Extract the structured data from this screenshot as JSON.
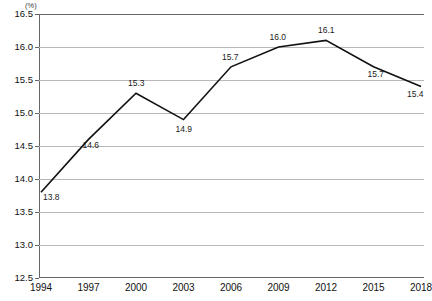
{
  "chart_data": {
    "type": "line",
    "title": "",
    "subtitle": "",
    "xlabel": "",
    "ylabel": "",
    "unit_label": "(%)",
    "categories": [
      "1994",
      "1997",
      "2000",
      "2003",
      "2006",
      "2009",
      "2012",
      "2015",
      "2018"
    ],
    "values": [
      13.8,
      14.6,
      15.3,
      14.9,
      15.7,
      16.0,
      16.1,
      15.7,
      15.4
    ],
    "point_labels": [
      "13.8",
      "14.6",
      "15.3",
      "14.9",
      "15.7",
      "16.0",
      "16.1",
      "15.7",
      "15.4"
    ],
    "ylim": [
      12.5,
      16.5
    ],
    "ytick_labels": [
      "16.5",
      "16.0",
      "15.5",
      "15.0",
      "14.5",
      "14.0",
      "13.5",
      "13.0",
      "12.5"
    ],
    "ytick_values": [
      16.5,
      16.0,
      15.5,
      15.0,
      14.5,
      14.0,
      13.5,
      13.0,
      12.5
    ],
    "grid": true,
    "legend": "none",
    "series_color": "#111111",
    "grid_color": "#b8b8b8",
    "axis_color": "#666666",
    "background_color": "#ffffff"
  },
  "header": {
    "clipped_title": ""
  },
  "footer": {
    "clipped_note": ""
  }
}
